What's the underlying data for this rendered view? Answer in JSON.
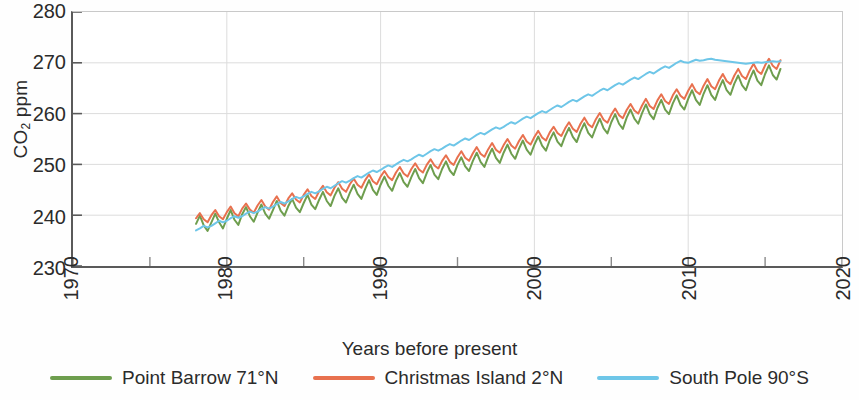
{
  "chart_data": {
    "type": "line",
    "title": "",
    "xlabel": "Years before present",
    "ylabel": "CO2 ppm",
    "ylabel_html": "CO<sub>2</sub> ppm",
    "xlim": [
      1970,
      2020
    ],
    "ylim": [
      230,
      280
    ],
    "xticks": [
      1970,
      1980,
      1990,
      2000,
      2010,
      2020
    ],
    "xtick_labels": [
      "1970",
      "1980",
      "1990",
      "2000",
      "2010",
      "2020"
    ],
    "xminor_ticks": [
      1975,
      1985,
      1995,
      2005,
      2015
    ],
    "yticks": [
      230,
      240,
      250,
      260,
      270,
      280
    ],
    "ytick_labels": [
      "230",
      "240",
      "250",
      "260",
      "270",
      "280"
    ],
    "grid": true,
    "grid_color": "#dcdcdc",
    "legend_position": "below",
    "x_start": 1978,
    "x_end": 2016,
    "x_step": 0.25,
    "series": [
      {
        "name": "Point Barrow 71°N",
        "color": "#6e9e4e",
        "label": "Point Barrow 71°N",
        "seasonal_amplitude": 1.5,
        "seasonal_phase": 0.0,
        "offset": -0.9,
        "values": [
          238.3,
          239.9,
          238.0,
          236.9,
          238.6,
          240.3,
          238.6,
          237.4,
          239.3,
          241.0,
          239.1,
          238.1,
          240.2,
          241.6,
          239.8,
          238.7,
          240.5,
          242.1,
          240.3,
          239.3,
          241.0,
          242.8,
          240.9,
          239.9,
          241.8,
          243.2,
          241.5,
          240.6,
          242.4,
          244.0,
          242.1,
          241.2,
          243.0,
          244.6,
          242.8,
          241.8,
          243.8,
          245.3,
          243.4,
          242.5,
          244.4,
          246.0,
          244.2,
          243.2,
          245.2,
          246.9,
          245.0,
          244.0,
          246.0,
          247.6,
          245.8,
          244.8,
          246.8,
          248.3,
          246.5,
          245.6,
          247.5,
          249.1,
          247.3,
          246.3,
          248.3,
          249.9,
          248.0,
          247.1,
          249.1,
          250.6,
          248.8,
          247.9,
          249.9,
          251.4,
          249.6,
          248.7,
          250.7,
          252.3,
          250.5,
          249.5,
          251.5,
          253.1,
          251.3,
          250.3,
          252.3,
          253.9,
          252.1,
          251.1,
          253.1,
          254.7,
          252.9,
          251.9,
          253.9,
          255.5,
          253.7,
          252.7,
          254.8,
          256.3,
          254.5,
          253.6,
          255.6,
          257.2,
          255.4,
          254.4,
          256.5,
          258.1,
          256.2,
          255.3,
          257.3,
          259.0,
          257.1,
          256.1,
          258.3,
          259.9,
          258.0,
          257.0,
          259.2,
          260.8,
          259.0,
          258.0,
          260.1,
          261.8,
          259.9,
          258.9,
          261.1,
          262.7,
          260.8,
          259.9,
          262.0,
          263.6,
          261.7,
          260.8,
          262.9,
          264.6,
          262.7,
          261.7,
          263.9,
          265.6,
          263.7,
          262.7,
          264.9,
          266.6,
          264.6,
          263.7,
          265.9,
          267.5,
          265.6,
          264.6,
          266.8,
          268.5,
          266.5,
          265.6,
          267.8,
          269.5,
          267.6,
          266.7,
          268.8,
          270.2,
          269.6,
          269.0,
          270.3
        ]
      },
      {
        "name": "Christmas Island 2°N",
        "color": "#e8714f",
        "label": "Christmas Island 2°N",
        "seasonal_amplitude": 0.9,
        "seasonal_phase": 0.15,
        "offset": 1.2,
        "values": [
          239.4,
          240.4,
          239.2,
          238.6,
          240.0,
          241.0,
          239.8,
          239.2,
          240.6,
          241.7,
          240.4,
          239.8,
          241.3,
          242.3,
          241.1,
          240.5,
          241.9,
          243.0,
          241.7,
          241.1,
          242.6,
          243.7,
          242.4,
          241.8,
          243.3,
          244.3,
          243.1,
          242.5,
          244.0,
          245.1,
          243.8,
          243.2,
          244.7,
          245.8,
          244.5,
          243.9,
          245.4,
          246.5,
          245.2,
          244.6,
          246.1,
          247.2,
          246.0,
          245.4,
          246.9,
          248.0,
          246.7,
          246.1,
          247.6,
          248.7,
          247.5,
          246.9,
          248.4,
          249.5,
          248.2,
          247.6,
          249.1,
          250.2,
          249.0,
          248.4,
          249.9,
          251.0,
          249.8,
          249.2,
          250.7,
          251.8,
          250.5,
          249.9,
          251.4,
          252.6,
          251.3,
          250.7,
          252.2,
          253.4,
          252.1,
          251.5,
          253.0,
          254.2,
          252.9,
          252.3,
          253.8,
          255.0,
          253.7,
          253.1,
          254.6,
          255.8,
          254.5,
          253.9,
          255.4,
          256.6,
          255.3,
          254.7,
          256.3,
          257.4,
          256.2,
          255.6,
          257.1,
          258.3,
          257.0,
          256.4,
          258.0,
          259.2,
          257.9,
          257.3,
          258.9,
          260.1,
          258.8,
          258.2,
          259.8,
          261.0,
          259.7,
          259.1,
          260.7,
          261.9,
          260.6,
          260.0,
          261.6,
          262.9,
          261.5,
          260.9,
          262.6,
          263.8,
          262.5,
          261.9,
          263.6,
          264.8,
          263.5,
          262.9,
          264.5,
          265.8,
          264.4,
          263.8,
          265.5,
          266.8,
          265.4,
          264.8,
          266.5,
          267.8,
          266.4,
          265.8,
          267.5,
          268.8,
          267.4,
          266.8,
          268.5,
          269.8,
          268.4,
          267.8,
          269.5,
          270.8,
          269.4,
          268.8,
          270.5,
          271.5,
          270.6,
          270.2,
          271.2
        ]
      },
      {
        "name": "South Pole 90°S",
        "color": "#6ec6e8",
        "label": "South Pole 90°S",
        "seasonal_amplitude": 0.45,
        "seasonal_phase": 0.55,
        "offset": -0.4,
        "values": [
          237.0,
          237.4,
          237.9,
          237.6,
          237.9,
          238.4,
          238.9,
          238.6,
          238.9,
          239.4,
          239.8,
          239.5,
          239.8,
          240.3,
          240.7,
          240.4,
          240.7,
          241.2,
          241.6,
          241.3,
          241.7,
          242.2,
          242.6,
          242.3,
          242.7,
          243.2,
          243.6,
          243.3,
          243.7,
          244.2,
          244.6,
          244.3,
          244.7,
          245.2,
          245.6,
          245.3,
          245.8,
          246.3,
          246.7,
          246.4,
          246.8,
          247.3,
          247.7,
          247.4,
          247.9,
          248.4,
          248.8,
          248.5,
          248.9,
          249.4,
          249.8,
          249.5,
          250.0,
          250.5,
          250.9,
          250.6,
          251.0,
          251.5,
          251.9,
          251.6,
          252.1,
          252.6,
          253.0,
          252.7,
          253.1,
          253.6,
          254.0,
          253.7,
          254.2,
          254.7,
          255.1,
          254.8,
          255.3,
          255.8,
          256.2,
          255.9,
          256.4,
          256.9,
          257.3,
          257.0,
          257.4,
          257.9,
          258.3,
          258.0,
          258.5,
          259.0,
          259.4,
          259.1,
          259.6,
          260.1,
          260.5,
          260.2,
          260.7,
          261.2,
          261.6,
          261.3,
          261.8,
          262.3,
          262.7,
          262.4,
          262.9,
          263.4,
          263.8,
          263.5,
          264.0,
          264.5,
          264.9,
          264.6,
          265.1,
          265.6,
          266.0,
          265.7,
          266.2,
          266.7,
          267.1,
          266.8,
          267.3,
          267.8,
          268.2,
          267.9,
          268.4,
          268.9,
          269.3,
          269.0,
          269.5,
          270.0,
          270.4,
          270.1,
          270.0,
          270.3,
          270.6,
          270.4,
          270.5,
          270.7,
          270.8,
          270.6,
          270.5,
          270.4,
          270.3,
          270.2,
          270.1,
          270.0,
          269.9,
          269.8,
          269.9,
          270.0,
          270.1,
          270.0,
          270.1,
          270.2,
          270.3,
          270.2,
          270.3,
          270.4,
          270.3,
          270.2,
          270.3
        ]
      }
    ]
  },
  "axis": {
    "ylabel_text": "CO",
    "ylabel_sub": "2",
    "ylabel_unit": " ppm",
    "xlabel": "Years before present"
  },
  "legend": {
    "items": [
      {
        "label": "Point Barrow 71°N",
        "color": "#6e9e4e"
      },
      {
        "label": "Christmas Island 2°N",
        "color": "#e8714f"
      },
      {
        "label": "South Pole 90°S",
        "color": "#6ec6e8"
      }
    ]
  }
}
